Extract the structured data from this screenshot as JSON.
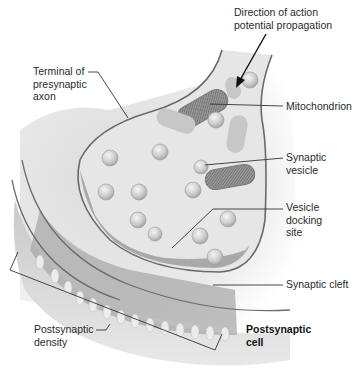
{
  "diagram": {
    "labels": {
      "direction": "Direction of action\npotential propagation",
      "terminal": "Terminal of\npresynaptic\naxon",
      "mitochondrion": "Mitochondrion",
      "synaptic_vesicle": "Synaptic\nvesicle",
      "docking_site": "Vesicle\ndocking\nsite",
      "synaptic_cleft": "Synaptic cleft",
      "postsynaptic_density": "Postsynaptic\ndensity",
      "postsynaptic_cell": "Postsynaptic\ncell"
    },
    "colors": {
      "background": "#ffffff",
      "cytoplasm": "#e9e9e9",
      "membrane": "#6e6e6e",
      "postsynaptic_body": "#b8b8b8",
      "density": "#8f8f8f",
      "vesicle": "#cfcfcf",
      "mitochondrion": "#8a8a8a",
      "leader_line": "#333333"
    }
  }
}
